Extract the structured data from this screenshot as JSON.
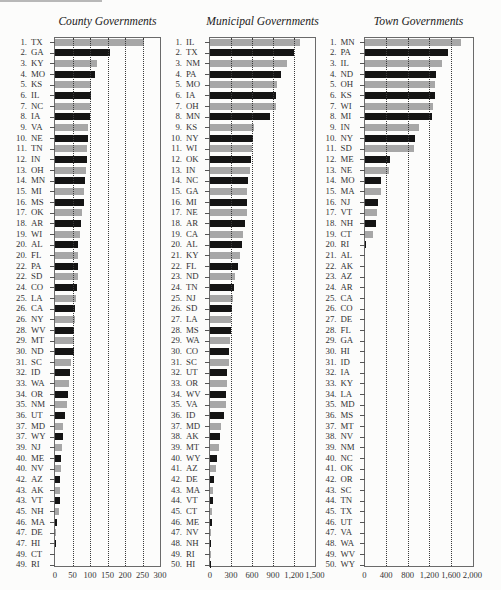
{
  "bar_colors": {
    "odd": "#a7a7a7",
    "even": "#141414",
    "grid": "#3a3a3a",
    "frame": "#6a6a6a"
  },
  "chart_data": [
    {
      "type": "bar",
      "orientation": "horizontal",
      "title": "County Governments",
      "xlabel": "",
      "ylabel": "",
      "xlim": [
        0,
        300
      ],
      "xticks": [
        0,
        50,
        100,
        150,
        200,
        250,
        300
      ],
      "xtick_labels": [
        "0",
        "50",
        "100",
        "150",
        "200",
        "250",
        "300"
      ],
      "grid": "vertical dotted",
      "ranks": [
        "1.",
        "2.",
        "3.",
        "4.",
        "5.",
        "6.",
        "7.",
        "8.",
        "9.",
        "10.",
        "11.",
        "12.",
        "13.",
        "14.",
        "15.",
        "16.",
        "17.",
        "18.",
        "19.",
        "20.",
        "20.",
        "22.",
        "22.",
        "24.",
        "25.",
        "26.",
        "26.",
        "28.",
        "29.",
        "30.",
        "31.",
        "32.",
        "33.",
        "34.",
        "35.",
        "36.",
        "37.",
        "37.",
        "39.",
        "40.",
        "40.",
        "42.",
        "43.",
        "43.",
        "45.",
        "46.",
        "47.",
        "47.",
        "49.",
        "49."
      ],
      "categories": [
        "TX",
        "GA",
        "KY",
        "MO",
        "KS",
        "IL",
        "NC",
        "IA",
        "VA",
        "NE",
        "TN",
        "IN",
        "OH",
        "MN",
        "MI",
        "MS",
        "OK",
        "AR",
        "WI",
        "AL",
        "FL",
        "PA",
        "SD",
        "CO",
        "LA",
        "CA",
        "NY",
        "WV",
        "MT",
        "ND",
        "SC",
        "ID",
        "WA",
        "OR",
        "NM",
        "UT",
        "MD",
        "WY",
        "NJ",
        "ME",
        "NV",
        "AZ",
        "AK",
        "VT",
        "NH",
        "MA",
        "DE",
        "HI",
        "CT",
        "RI"
      ],
      "values": [
        254,
        156,
        119,
        114,
        104,
        102,
        100,
        99,
        95,
        93,
        92,
        91,
        88,
        87,
        83,
        82,
        77,
        75,
        72,
        67,
        67,
        66,
        66,
        62,
        60,
        57,
        57,
        55,
        54,
        53,
        46,
        44,
        39,
        36,
        33,
        29,
        23,
        23,
        21,
        16,
        16,
        15,
        14,
        14,
        10,
        5,
        3,
        3,
        0,
        0
      ]
    },
    {
      "type": "bar",
      "orientation": "horizontal",
      "title": "Municipal Governments",
      "xlabel": "",
      "ylabel": "",
      "xlim": [
        0,
        1500
      ],
      "xticks": [
        0,
        300,
        600,
        900,
        1200,
        1500
      ],
      "xtick_labels": [
        "0",
        "300",
        "600",
        "900",
        "1,200",
        "1,500"
      ],
      "grid": "vertical dotted",
      "ranks": [
        "1.",
        "2.",
        "3.",
        "4.",
        "5.",
        "6.",
        "7.",
        "8.",
        "9.",
        "10.",
        "11.",
        "12.",
        "13.",
        "14.",
        "15.",
        "16.",
        "17.",
        "18.",
        "19.",
        "20.",
        "21.",
        "22.",
        "23.",
        "24.",
        "25.",
        "26.",
        "27.",
        "28.",
        "29.",
        "30.",
        "31.",
        "32.",
        "33.",
        "34.",
        "35.",
        "36.",
        "37.",
        "38.",
        "39.",
        "40.",
        "41.",
        "42.",
        "43.",
        "44.",
        "45.",
        "46.",
        "47.",
        "48.",
        "49.",
        "50."
      ],
      "categories": [
        "IL",
        "TX",
        "NM",
        "PA",
        "MO",
        "IA",
        "OH",
        "MN",
        "KS",
        "NY",
        "WI",
        "OK",
        "IN",
        "NC",
        "GA",
        "MI",
        "NE",
        "AR",
        "CA",
        "AL",
        "KY",
        "FL",
        "ND",
        "TN",
        "NJ",
        "SD",
        "LA",
        "MS",
        "WA",
        "CO",
        "SC",
        "UT",
        "OR",
        "WV",
        "VA",
        "ID",
        "MD",
        "AK",
        "MT",
        "WY",
        "AZ",
        "DE",
        "MA",
        "VT",
        "CT",
        "ME",
        "NV",
        "NH",
        "RI",
        "HI"
      ],
      "values": [
        1291,
        1196,
        1100,
        1018,
        952,
        948,
        942,
        854,
        627,
        616,
        600,
        590,
        567,
        541,
        535,
        533,
        530,
        499,
        475,
        451,
        424,
        404,
        360,
        349,
        324,
        308,
        302,
        296,
        281,
        270,
        269,
        242,
        240,
        234,
        229,
        200,
        157,
        149,
        129,
        98,
        87,
        57,
        47,
        45,
        30,
        22,
        19,
        13,
        8,
        1
      ]
    },
    {
      "type": "bar",
      "orientation": "horizontal",
      "title": "Town Governments",
      "xlabel": "",
      "ylabel": "",
      "xlim": [
        0,
        2000
      ],
      "xticks": [
        0,
        400,
        800,
        1200,
        1600,
        2000
      ],
      "xtick_labels": [
        "0",
        "400",
        "800",
        "1,200",
        "1,600",
        "2,000"
      ],
      "grid": "vertical dotted",
      "ranks": [
        "1.",
        "2.",
        "3.",
        "4.",
        "5.",
        "6.",
        "7.",
        "8.",
        "9.",
        "10.",
        "11.",
        "12.",
        "13.",
        "14.",
        "15.",
        "16.",
        "17.",
        "18.",
        "19.",
        "20.",
        "21.",
        "22.",
        "23.",
        "24.",
        "25.",
        "26.",
        "27.",
        "28.",
        "29.",
        "30.",
        "31.",
        "32.",
        "33.",
        "34.",
        "35.",
        "36.",
        "37.",
        "38.",
        "39.",
        "40.",
        "41.",
        "42.",
        "43.",
        "44.",
        "45.",
        "46.",
        "47.",
        "48.",
        "49.",
        "50."
      ],
      "categories": [
        "MN",
        "PA",
        "IL",
        "ND",
        "OH",
        "KS",
        "WI",
        "MI",
        "IN",
        "NY",
        "SD",
        "ME",
        "NE",
        "MO",
        "MA",
        "NJ",
        "VT",
        "NH",
        "CT",
        "RI",
        "AL",
        "AK",
        "AZ",
        "AR",
        "CA",
        "CO",
        "DE",
        "FL",
        "GA",
        "HI",
        "ID",
        "IA",
        "KY",
        "LA",
        "MD",
        "MS",
        "MT",
        "NV",
        "NM",
        "NC",
        "OK",
        "OR",
        "SC",
        "TN",
        "TX",
        "UT",
        "VA",
        "WA",
        "WV",
        "WY"
      ],
      "values": [
        1793,
        1546,
        1431,
        1332,
        1308,
        1299,
        1265,
        1242,
        1008,
        929,
        916,
        467,
        446,
        312,
        306,
        242,
        237,
        221,
        149,
        31,
        0,
        0,
        0,
        0,
        0,
        0,
        0,
        0,
        0,
        0,
        0,
        0,
        0,
        0,
        0,
        0,
        0,
        0,
        0,
        0,
        0,
        0,
        0,
        0,
        0,
        0,
        0,
        0,
        0,
        0
      ]
    }
  ]
}
